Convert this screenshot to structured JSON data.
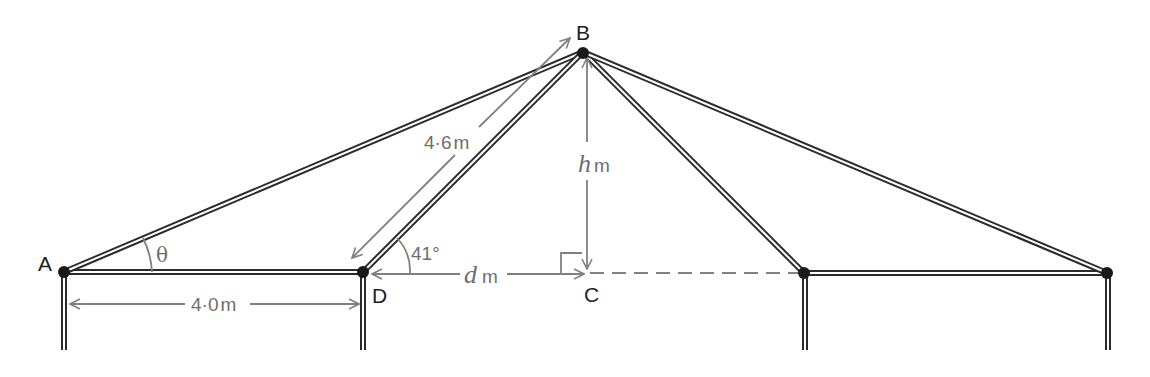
{
  "diagram": {
    "type": "roof-frame-geometry",
    "colors": {
      "beam": "#2b2b2b",
      "beam_fill": "#ffffff",
      "node": "#1a1a1a",
      "dimension": "#808080",
      "label": "#222222"
    },
    "points": {
      "A": {
        "label": "A",
        "x": 64,
        "y": 272
      },
      "B": {
        "label": "B",
        "x": 583,
        "y": 52
      },
      "C": {
        "label": "C",
        "x": 587,
        "y": 272
      },
      "D": {
        "label": "D",
        "x": 363,
        "y": 272
      },
      "E": {
        "label": "",
        "x": 804,
        "y": 273
      },
      "F": {
        "label": "",
        "x": 1107,
        "y": 273
      }
    },
    "labels": {
      "A": "A",
      "B": "B",
      "C": "C",
      "D": "D"
    },
    "measurements": {
      "AD": {
        "value": "4·0",
        "unit": "m"
      },
      "DB": {
        "value": "4·6",
        "unit": "m"
      },
      "BC": {
        "var": "h",
        "unit": "m"
      },
      "DC": {
        "var": "d",
        "unit": "m"
      }
    },
    "angles": {
      "theta": {
        "symbol": "θ",
        "at": "A"
      },
      "angle_D": {
        "value": "41°",
        "at": "D"
      },
      "right_angle": {
        "at": "C"
      }
    }
  }
}
